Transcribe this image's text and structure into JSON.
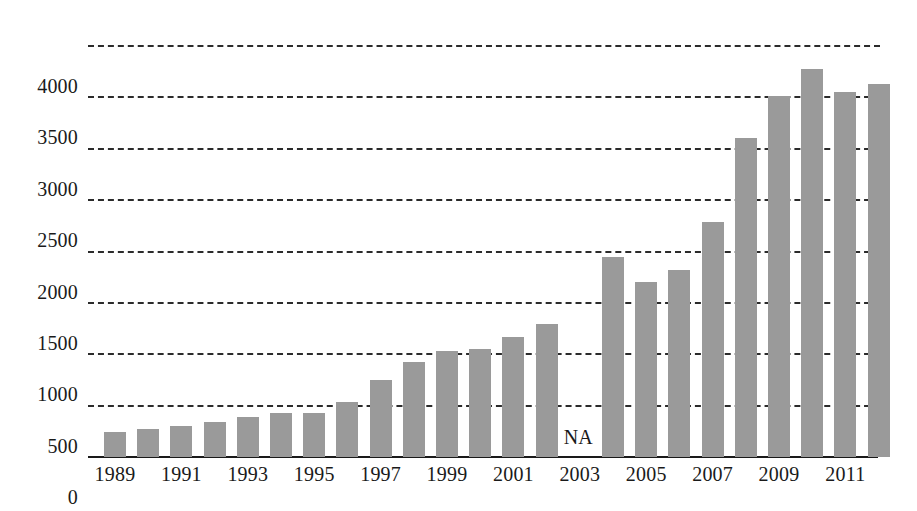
{
  "chart_data": {
    "type": "bar",
    "title": "",
    "subtitle": "",
    "xlabel": "",
    "ylabel": "",
    "ylim": [
      0,
      4000
    ],
    "ytick_interval": 500,
    "yticks": [
      "0",
      "500",
      "1000",
      "1500",
      "2000",
      "2500",
      "3000",
      "3500",
      "4000"
    ],
    "ytick_values": [
      0,
      500,
      1000,
      1500,
      2000,
      2500,
      3000,
      3500,
      4000
    ],
    "xticks": [
      "1989",
      "1991",
      "1993",
      "1995",
      "1997",
      "1999",
      "2001",
      "2003",
      "2005",
      "2007",
      "2009",
      "2011"
    ],
    "xtick_values": [
      1989,
      1991,
      1993,
      1995,
      1997,
      1999,
      2001,
      2003,
      2005,
      2007,
      2009,
      2011
    ],
    "grid": "horizontal-dashed",
    "legend": "none",
    "bar_color": "#9a9a9a",
    "axis_color": "#1a1a1a",
    "gridline_color": "#2b2b2b",
    "missing_label": "NA",
    "missing_categories": [
      "2003"
    ],
    "categories": [
      "1989",
      "1990",
      "1991",
      "1992",
      "1993",
      "1994",
      "1995",
      "1996",
      "1997",
      "1998",
      "1999",
      "2000",
      "2001",
      "2002",
      "2003",
      "2004",
      "2005",
      "2006",
      "2007",
      "2008",
      "2009",
      "2010",
      "2011",
      "2012"
    ],
    "values": [
      240,
      275,
      305,
      345,
      385,
      425,
      425,
      540,
      750,
      920,
      1030,
      1050,
      1170,
      1290,
      null,
      1950,
      1700,
      1820,
      2290,
      3100,
      3510,
      3780,
      3550,
      3630
    ]
  }
}
